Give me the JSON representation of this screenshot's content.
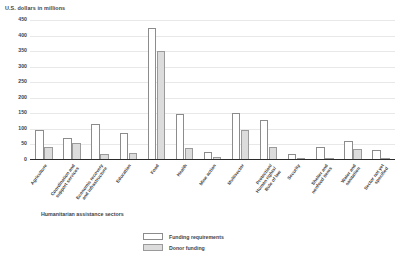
{
  "chart_data": {
    "type": "bar",
    "title": "",
    "ylabel": "U.S. dollars in millions",
    "xlabel": "Humanitarian assistance sectors",
    "ylim": [
      0,
      450
    ],
    "yticks": [
      0,
      50,
      100,
      150,
      200,
      250,
      300,
      350,
      400,
      450
    ],
    "ytick_labels": [
      "0",
      "50",
      "100",
      "150",
      "200",
      "250",
      "300",
      "350",
      "400",
      "450"
    ],
    "grid": false,
    "legend_position": "bottom-center",
    "categories": [
      "Agriculture",
      "Coordination and support services",
      "Economic recovery and infrastructure",
      "Education",
      "Food",
      "Health",
      "Mine action",
      "Multisector",
      "Protection/Human rights/Rule of law",
      "Security",
      "Shelter and nonfood items",
      "Water and sanitation",
      "Sector not yet specified"
    ],
    "category_lines": [
      [
        "Agriculture"
      ],
      [
        "Coordination and",
        "support services"
      ],
      [
        "Economic recovery",
        "and infrastructure"
      ],
      [
        "Education"
      ],
      [
        "Food"
      ],
      [
        "Health"
      ],
      [
        "Mine action"
      ],
      [
        "Multisector"
      ],
      [
        "Protection/",
        "Human rights/",
        "Rule of law"
      ],
      [
        "Security"
      ],
      [
        "Shelter and",
        "nonfood items"
      ],
      [
        "Water and",
        "sanitation"
      ],
      [
        "Sector not yet",
        "specified"
      ]
    ],
    "series": [
      {
        "name": "Funding requirements",
        "color": "#ffffff",
        "values": [
          95,
          70,
          115,
          88,
          425,
          148,
          25,
          150,
          128,
          18,
          42,
          62,
          32
        ]
      },
      {
        "name": "Donor funding",
        "color": "#dcdcdc",
        "values": [
          42,
          55,
          18,
          22,
          350,
          40,
          10,
          95,
          42,
          3,
          5,
          35,
          2
        ]
      }
    ]
  },
  "legend": {
    "items": [
      {
        "label": "Funding requirements",
        "style": "req"
      },
      {
        "label": "Donor funding",
        "style": "donor"
      }
    ]
  }
}
